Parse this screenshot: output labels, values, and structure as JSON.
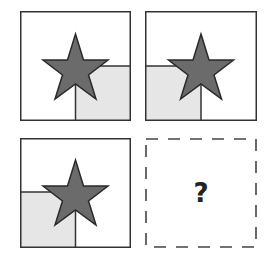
{
  "puzzle": {
    "colors": {
      "border": "#333333",
      "star_fill": "#6b6b6b",
      "star_stroke": "#2a2a2a",
      "shade": "#e6e6e6",
      "background": "#ffffff",
      "question_mark": "#222222"
    },
    "panels": [
      {
        "id": "panel-1",
        "row": 1,
        "col": 1,
        "shape": "star",
        "shaded_quadrant": "bottom-right"
      },
      {
        "id": "panel-2",
        "row": 1,
        "col": 2,
        "shape": "star",
        "shaded_quadrant": "bottom-left"
      },
      {
        "id": "panel-3",
        "row": 2,
        "col": 1,
        "shape": "star",
        "shaded_quadrant": "bottom-left"
      },
      {
        "id": "panel-4",
        "row": 2,
        "col": 2,
        "shape": "unknown",
        "dashed": true,
        "label": "?"
      }
    ]
  }
}
